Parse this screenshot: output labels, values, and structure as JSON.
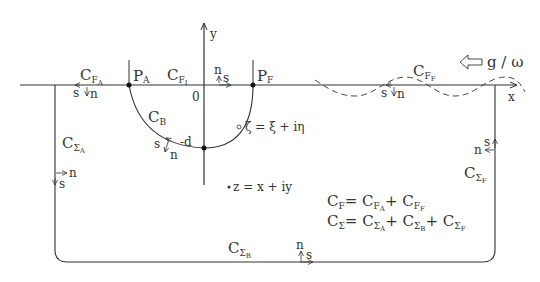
{
  "diagram": {
    "type": "contour-diagram",
    "axes": {
      "x_label": "x",
      "y_label": "y",
      "origin_label": "0",
      "depth_label": "-d"
    },
    "points": {
      "pa": "P",
      "pa_sub": "A",
      "pf": "P",
      "pf_sub": "F"
    },
    "contours": {
      "cfa": {
        "main": "C",
        "sub1": "F",
        "sub2": "A"
      },
      "cfi": {
        "main": "C",
        "sub1": "F",
        "sub2": "I"
      },
      "cff": {
        "main": "C",
        "sub1": "F",
        "sub2": "F"
      },
      "cb": {
        "main": "C",
        "sub1": "B"
      },
      "csa": {
        "main": "C",
        "sub1": "Σ",
        "sub2": "A"
      },
      "csb": {
        "main": "C",
        "sub1": "Σ",
        "sub2": "B"
      },
      "csf": {
        "main": "C",
        "sub1": "Σ",
        "sub2": "F"
      }
    },
    "normals": {
      "s": "s",
      "n": "n"
    },
    "annotations": {
      "zeta": "ζ = ξ + iη",
      "z": "z = x + iy",
      "incoming": "g / ω"
    },
    "equations": {
      "eq1_lhs": "C",
      "eq1_lhs_sub": "F",
      "eq1_rhs": "= C",
      "eq1_t1_sub1": "F",
      "eq1_t1_sub2": "A",
      "eq1_plus": "+ C",
      "eq1_t2_sub1": "F",
      "eq1_t2_sub2": "F",
      "eq2_lhs": "C",
      "eq2_lhs_sub": "Σ",
      "eq2_rhs": "= C",
      "eq2_t1_sub1": "Σ",
      "eq2_t1_sub2": "A",
      "eq2_plus1": "+ C",
      "eq2_t2_sub1": "Σ",
      "eq2_t2_sub2": "B",
      "eq2_plus2": "+ C",
      "eq2_t3_sub1": "Σ",
      "eq2_t3_sub2": "F"
    },
    "colors": {
      "line": "#333333",
      "text": "#333333",
      "background": "#ffffff"
    }
  }
}
